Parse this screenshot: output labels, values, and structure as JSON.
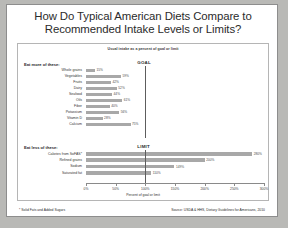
{
  "title": {
    "line1": "How Do Typical American Diets Compare to",
    "line2": "Recommended Intake Levels or Limits?"
  },
  "footer": {
    "footnote": "* Solid Fats and Added Sugars",
    "source": "Source: USDA & HHS, Dietary Guidelines for Americans, 2010"
  },
  "colors": {
    "bar": "#a8a8a8",
    "reference_line": "#5d5d5d",
    "panel_border": "#b5b5b5",
    "page_background": "#ffffff",
    "desk_background": "#b9b9b6"
  },
  "chart_data": {
    "type": "bar",
    "orientation": "horizontal",
    "title": "How Do Typical American Diets Compare to Recommended Intake Levels or Limits?",
    "subtitle": "Usual intake as a percent of goal or limit",
    "xlabel": "Percent of goal or limit",
    "ylabel": "",
    "xlim": [
      0,
      300
    ],
    "xticks": [
      0,
      50,
      100,
      150,
      200,
      250,
      300
    ],
    "xticklabels": [
      "0%",
      "50%",
      "100%",
      "150%",
      "200%",
      "250%",
      "300%"
    ],
    "grid": false,
    "legend": "none",
    "groups": [
      {
        "heading": "Eat more of these:",
        "reference_label": "GOAL",
        "reference_value": 100,
        "categories": [
          "Whole grains",
          "Vegetables",
          "Fruits",
          "Dairy",
          "Seafood",
          "Oils",
          "Fiber",
          "Potassium",
          "Vitamin D",
          "Calcium"
        ],
        "values": [
          15,
          59,
          42,
          52,
          44,
          61,
          40,
          56,
          28,
          75
        ],
        "value_labels": [
          "15%",
          "59%",
          "42%",
          "52%",
          "44%",
          "61%",
          "40%",
          "56%",
          "28%",
          "75%"
        ]
      },
      {
        "heading": "Eat less of these:",
        "reference_label": "LIMIT",
        "reference_value": 100,
        "categories": [
          "Calories from SoFAS*",
          "Refined grains",
          "Sodium",
          "Saturated fat"
        ],
        "values": [
          280,
          200,
          149,
          110
        ],
        "value_labels": [
          "280%",
          "200%",
          "149%",
          "110%"
        ]
      }
    ]
  }
}
